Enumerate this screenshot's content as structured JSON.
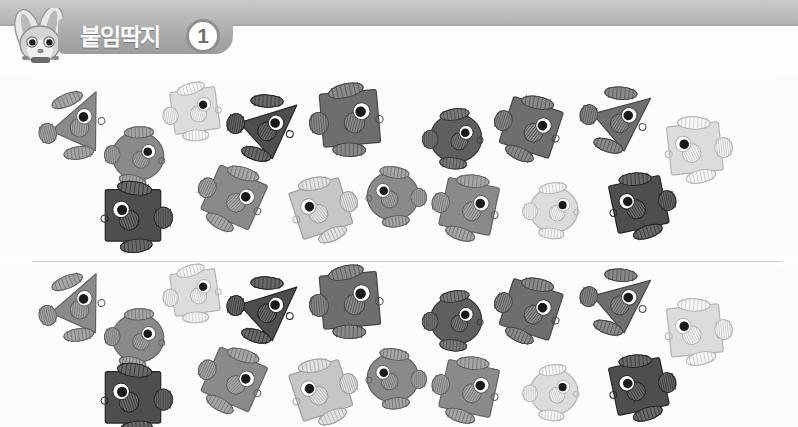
{
  "header": {
    "title": "붙임딱지",
    "number": "1",
    "mascot_icon": "rabbit-mascot-icon",
    "band_color": "#bdbdbd",
    "pill_color": "#a9a9a9"
  },
  "badge": {
    "label": "02"
  },
  "palette": {
    "darkest": "#4e4e4e",
    "dark": "#5f5f5f",
    "mid_dark": "#6e6e6e",
    "mid": "#8a8a8a",
    "light": "#a8a8a8",
    "lighter": "#c6c6c6",
    "lightest": "#dcdcdc",
    "fin": "#bdbdbd",
    "outline": "#7a7a7a",
    "eye_white": "#ffffff",
    "eye_black": "#1a1a1a",
    "page_bg": "#fbfbfb"
  },
  "panels": [
    {
      "name": "sticker-panel-top",
      "fish": [
        {
          "id": "f1",
          "shape": "triangle",
          "x": 44,
          "y": 94,
          "size": 62,
          "rot": -14,
          "tone": "mid",
          "flip": false
        },
        {
          "id": "f2",
          "shape": "circle",
          "x": 110,
          "y": 128,
          "size": 56,
          "rot": 6,
          "tone": "mid",
          "flip": false
        },
        {
          "id": "f3",
          "shape": "square",
          "x": 168,
          "y": 84,
          "size": 54,
          "rot": -8,
          "tone": "lightest",
          "flip": false
        },
        {
          "id": "f4",
          "shape": "triangle",
          "x": 233,
          "y": 96,
          "size": 62,
          "rot": 10,
          "tone": "darkest",
          "flip": false
        },
        {
          "id": "f5",
          "shape": "square",
          "x": 316,
          "y": 85,
          "size": 68,
          "rot": -5,
          "tone": "mid_dark",
          "flip": false
        },
        {
          "id": "f6",
          "shape": "circle",
          "x": 428,
          "y": 110,
          "size": 56,
          "rot": 0,
          "tone": "dark",
          "flip": false
        },
        {
          "id": "f7",
          "shape": "square",
          "x": 500,
          "y": 97,
          "size": 62,
          "rot": 18,
          "tone": "mid_dark",
          "flip": false
        },
        {
          "id": "f8",
          "shape": "triangle",
          "x": 586,
          "y": 88,
          "size": 62,
          "rot": 12,
          "tone": "mid_dark",
          "flip": false
        },
        {
          "id": "f9",
          "shape": "square",
          "x": 664,
          "y": 118,
          "size": 62,
          "rot": -6,
          "tone": "lightest",
          "flip": true
        },
        {
          "id": "f10",
          "shape": "square",
          "x": 100,
          "y": 183,
          "size": 66,
          "rot": 0,
          "tone": "darkest",
          "flip": true
        },
        {
          "id": "f11",
          "shape": "square",
          "x": 203,
          "y": 167,
          "size": 62,
          "rot": 24,
          "tone": "mid",
          "flip": false
        },
        {
          "id": "f12",
          "shape": "square",
          "x": 290,
          "y": 178,
          "size": 62,
          "rot": -18,
          "tone": "lighter",
          "flip": true
        },
        {
          "id": "f13",
          "shape": "circle",
          "x": 365,
          "y": 168,
          "size": 56,
          "rot": 0,
          "tone": "mid",
          "flip": true
        },
        {
          "id": "f14",
          "shape": "square",
          "x": 438,
          "y": 176,
          "size": 62,
          "rot": 12,
          "tone": "mid",
          "flip": false
        },
        {
          "id": "f15",
          "shape": "circle",
          "x": 528,
          "y": 184,
          "size": 52,
          "rot": 0,
          "tone": "lightest",
          "flip": false
        },
        {
          "id": "f16",
          "shape": "square",
          "x": 608,
          "y": 174,
          "size": 62,
          "rot": -12,
          "tone": "darkest",
          "flip": true
        }
      ]
    },
    {
      "name": "sticker-panel-bottom",
      "fish": [
        {
          "id": "g1",
          "shape": "triangle",
          "x": 44,
          "y": 276,
          "size": 62,
          "rot": -14,
          "tone": "mid",
          "flip": false
        },
        {
          "id": "g2",
          "shape": "circle",
          "x": 110,
          "y": 310,
          "size": 56,
          "rot": 6,
          "tone": "mid",
          "flip": false
        },
        {
          "id": "g3",
          "shape": "square",
          "x": 168,
          "y": 266,
          "size": 54,
          "rot": -8,
          "tone": "lightest",
          "flip": false
        },
        {
          "id": "g4",
          "shape": "triangle",
          "x": 233,
          "y": 278,
          "size": 62,
          "rot": 10,
          "tone": "darkest",
          "flip": false
        },
        {
          "id": "g5",
          "shape": "square",
          "x": 316,
          "y": 267,
          "size": 68,
          "rot": -5,
          "tone": "mid_dark",
          "flip": false
        },
        {
          "id": "g6",
          "shape": "circle",
          "x": 428,
          "y": 292,
          "size": 56,
          "rot": 0,
          "tone": "dark",
          "flip": false
        },
        {
          "id": "g7",
          "shape": "square",
          "x": 500,
          "y": 279,
          "size": 62,
          "rot": 18,
          "tone": "mid_dark",
          "flip": false
        },
        {
          "id": "g8",
          "shape": "triangle",
          "x": 586,
          "y": 270,
          "size": 62,
          "rot": 12,
          "tone": "mid_dark",
          "flip": false
        },
        {
          "id": "g9",
          "shape": "square",
          "x": 664,
          "y": 300,
          "size": 62,
          "rot": -6,
          "tone": "lightest",
          "flip": true
        },
        {
          "id": "g10",
          "shape": "square",
          "x": 100,
          "y": 365,
          "size": 66,
          "rot": 0,
          "tone": "darkest",
          "flip": true
        },
        {
          "id": "g11",
          "shape": "square",
          "x": 203,
          "y": 349,
          "size": 62,
          "rot": 24,
          "tone": "mid",
          "flip": false
        },
        {
          "id": "g12",
          "shape": "square",
          "x": 290,
          "y": 360,
          "size": 62,
          "rot": -18,
          "tone": "lighter",
          "flip": true
        },
        {
          "id": "g13",
          "shape": "circle",
          "x": 365,
          "y": 350,
          "size": 56,
          "rot": 0,
          "tone": "mid",
          "flip": true
        },
        {
          "id": "g14",
          "shape": "square",
          "x": 438,
          "y": 358,
          "size": 62,
          "rot": 12,
          "tone": "mid",
          "flip": false
        },
        {
          "id": "g15",
          "shape": "circle",
          "x": 528,
          "y": 366,
          "size": 52,
          "rot": 0,
          "tone": "lightest",
          "flip": false
        },
        {
          "id": "g16",
          "shape": "square",
          "x": 608,
          "y": 356,
          "size": 62,
          "rot": -12,
          "tone": "darkest",
          "flip": true
        }
      ]
    }
  ]
}
